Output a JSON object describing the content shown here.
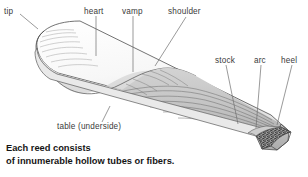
{
  "figure": {
    "background_color": "#ffffff",
    "line_color": "#4a4a4a",
    "label_color": "#3b3b3b",
    "caption_color": "#151515",
    "reed_top_fill": "#fcfcfc",
    "reed_vamp_fill": "#d8d8d8",
    "reed_stock_fill": "#c9c9c9",
    "reed_side_fill": "#b8b8b8",
    "heel_section_fill": "#6e6e6e"
  },
  "labels": [
    {
      "id": "tip",
      "text": "tip"
    },
    {
      "id": "heart",
      "text": "heart"
    },
    {
      "id": "vamp",
      "text": "vamp"
    },
    {
      "id": "shoulder",
      "text": "shoulder"
    },
    {
      "id": "stock",
      "text": "stock"
    },
    {
      "id": "arc",
      "text": "arc"
    },
    {
      "id": "heel",
      "text": "heel"
    },
    {
      "id": "table",
      "text": "table (underside)"
    }
  ],
  "caption": {
    "line1": "Each reed consists",
    "line2": "of innumerable hollow tubes or fibers."
  }
}
